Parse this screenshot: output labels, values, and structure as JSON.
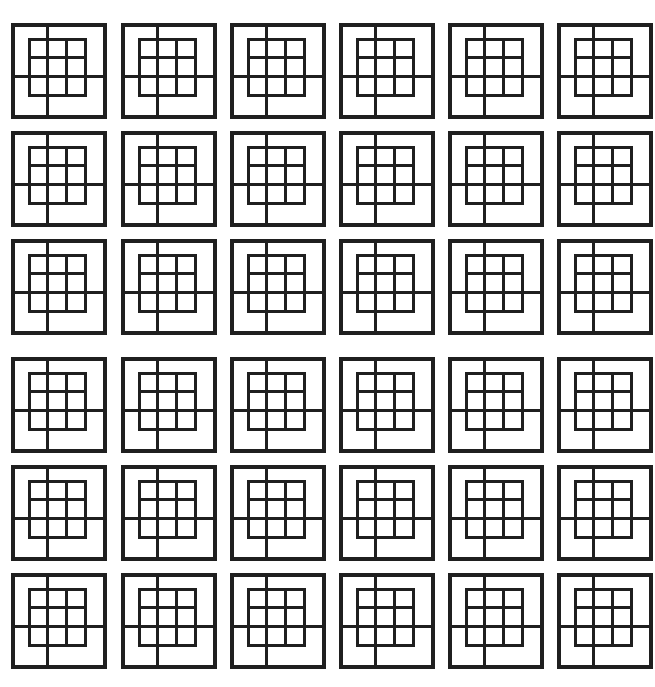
{
  "page": {
    "background_color": "#ffffff",
    "width": 655,
    "height": 687
  },
  "pattern": {
    "name": "nested-square-grid-motif",
    "description": "A 6 by 6 arrangement of identical square motifs. Each motif is an outer square frame containing a centered 3 by 3 grid of small squares, joined to the frame by four short connector bars at the midpoints of the frame edges.",
    "stroke_color": "#1f1f1f",
    "fill_color": "#ffffff",
    "rows": 6,
    "columns": 6,
    "tile_count": 36,
    "outer_stroke_width": 3.2,
    "inner_stroke_width": 3.0,
    "connector_stroke_width": 3.0,
    "outer_square_size": 92,
    "inner_grid_size": 56,
    "inner_grid_divisions": 3,
    "inner_offset_x": -2,
    "inner_offset_y": -4,
    "connector_axis_x_fraction": 0.3333,
    "connector_axis_y_fraction": 0.6667,
    "column_origins": [
      13,
      123,
      232,
      341,
      450,
      559
    ],
    "row_origins": [
      25,
      133,
      241,
      359,
      467,
      575
    ],
    "column_pitch": 109,
    "row_pitch_within_block": 108,
    "block_gap": 10
  },
  "tile": {
    "name": "nested-square-motif",
    "parts": [
      {
        "label": "outer-frame",
        "shape": "square"
      },
      {
        "label": "inner-grid",
        "shape": "3x3-square-grid"
      },
      {
        "label": "connector-top",
        "shape": "vertical-bar"
      },
      {
        "label": "connector-bottom",
        "shape": "vertical-bar"
      },
      {
        "label": "connector-left",
        "shape": "horizontal-bar"
      },
      {
        "label": "connector-right",
        "shape": "horizontal-bar"
      }
    ]
  }
}
